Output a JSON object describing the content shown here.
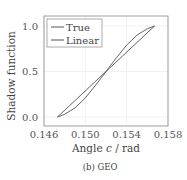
{
  "caption": "(b) GEO",
  "chart_data": {
    "type": "line",
    "title": "",
    "xlabel_prefix": "Angle ",
    "xlabel_var": "c",
    "xlabel_suffix": " / rad",
    "xlabel": "Angle c / rad",
    "ylabel": "Shadow function",
    "xlim": [
      0.146,
      0.158
    ],
    "ylim": [
      -0.1,
      1.1
    ],
    "xticks": [
      0.146,
      0.15,
      0.154,
      0.158
    ],
    "xtick_labels": [
      "0.146",
      "0.150",
      "0.154",
      "0.158"
    ],
    "yticks": [
      0.0,
      0.5,
      1.0
    ],
    "ytick_labels": [
      "0.0",
      "0.5",
      "1.0"
    ],
    "grid": true,
    "legend_position": "upper left",
    "series": [
      {
        "name": "True",
        "color": "#555555",
        "x": [
          0.1473,
          0.148,
          0.149,
          0.15,
          0.151,
          0.152,
          0.153,
          0.154,
          0.155,
          0.156,
          0.1567
        ],
        "y": [
          0.0,
          0.03,
          0.1,
          0.21,
          0.35,
          0.5,
          0.65,
          0.79,
          0.9,
          0.97,
          1.0
        ]
      },
      {
        "name": "Linear",
        "color": "#555555",
        "x": [
          0.1473,
          0.1567
        ],
        "y": [
          0.0,
          1.0
        ]
      }
    ]
  }
}
